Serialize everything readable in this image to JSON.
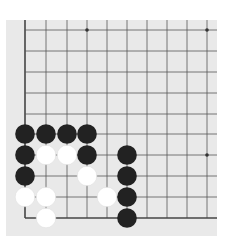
{
  "board": {
    "background": "#e9e9e9",
    "line_color": "#555555",
    "edge_color": "#444444",
    "columns_x": [
      25,
      46,
      67,
      87,
      107,
      127,
      147,
      167,
      187,
      207
    ],
    "rows_y": [
      30,
      51,
      72,
      93,
      114,
      134,
      155,
      176,
      197,
      218
    ],
    "right_edge_x": 217,
    "top_edge_y": 20,
    "left_edge_visible": true,
    "bottom_edge_visible": true,
    "star_points": [
      [
        87,
        30
      ],
      [
        207,
        30
      ],
      [
        207,
        155
      ]
    ]
  },
  "stones": [
    {
      "color": "black",
      "col": 0,
      "row": 5
    },
    {
      "color": "black",
      "col": 1,
      "row": 5
    },
    {
      "color": "black",
      "col": 2,
      "row": 5
    },
    {
      "color": "black",
      "col": 3,
      "row": 5
    },
    {
      "color": "black",
      "col": 0,
      "row": 6
    },
    {
      "color": "white",
      "col": 1,
      "row": 6
    },
    {
      "color": "white",
      "col": 2,
      "row": 6
    },
    {
      "color": "black",
      "col": 3,
      "row": 6
    },
    {
      "color": "black",
      "col": 5,
      "row": 6
    },
    {
      "color": "black",
      "col": 0,
      "row": 7
    },
    {
      "color": "white",
      "col": 3,
      "row": 7
    },
    {
      "color": "black",
      "col": 5,
      "row": 7
    },
    {
      "color": "white",
      "col": 0,
      "row": 8
    },
    {
      "color": "white",
      "col": 1,
      "row": 8
    },
    {
      "color": "white",
      "col": 4,
      "row": 8
    },
    {
      "color": "black",
      "col": 5,
      "row": 8
    },
    {
      "color": "white",
      "col": 1,
      "row": 9
    },
    {
      "color": "black",
      "col": 5,
      "row": 9
    }
  ],
  "colors": {
    "black_stone": "#222222",
    "white_stone": "#ffffff"
  }
}
